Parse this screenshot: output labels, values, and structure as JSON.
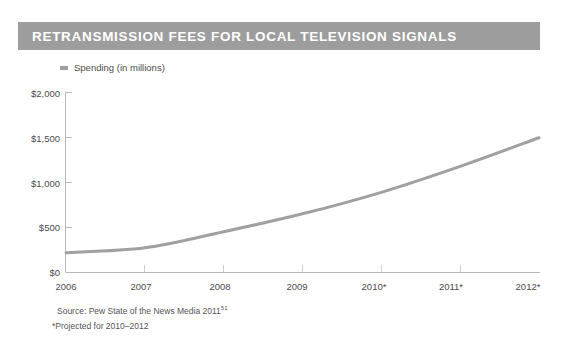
{
  "title": "RETRANSMISSION FEES FOR LOCAL TELEVISION SIGNALS",
  "legend": {
    "marker": "legend-swatch-icon",
    "label": "Spending (in millions)"
  },
  "notes": {
    "source_prefix": "Source: Pew State of the News Media 2011",
    "source_superscript": "51",
    "projection": "*Projected for 2010–2012"
  },
  "colors": {
    "title_bar": "#9d9d9d",
    "title_text": "#ffffff",
    "line": "#a0a0a0",
    "axis": "#b9b9b9",
    "text": "#4c4c4e",
    "background": "#ffffff"
  },
  "chart_data": {
    "type": "line",
    "title": "RETRANSMISSION FEES FOR LOCAL TELEVISION SIGNALS",
    "xlabel": "",
    "ylabel": "",
    "categories": [
      "2006",
      "2007",
      "2008",
      "2009",
      "2010*",
      "2011*",
      "2012*"
    ],
    "x": [
      2006,
      2007,
      2008,
      2009,
      2010,
      2011,
      2012
    ],
    "series": [
      {
        "name": "Spending (in millions)",
        "values": [
          215,
          270,
          450,
          650,
          890,
          1180,
          1500
        ],
        "color": "#a0a0a0"
      }
    ],
    "ylim": [
      0,
      2000
    ],
    "yticks": [
      0,
      500,
      1000,
      1500,
      2000
    ],
    "ytick_labels": [
      "$0",
      "$500",
      "$1,000",
      "$1,500",
      "$2,000"
    ],
    "xtick_labels": [
      "2006",
      "2007",
      "2008",
      "2009",
      "2010*",
      "2011*",
      "2012*"
    ],
    "grid": false,
    "legend_position": "top-left",
    "units": "millions of US dollars",
    "annotations": [
      "Source: Pew State of the News Media 2011 (note 51)",
      "*Projected for 2010–2012"
    ]
  }
}
